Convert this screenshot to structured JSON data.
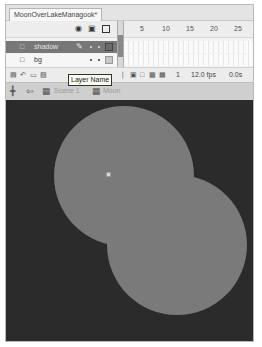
{
  "document": {
    "tab_title": "MoonOverLakeManagook*"
  },
  "timeline": {
    "header_icons": {
      "eye": "eye-icon",
      "lock": "lock-icon",
      "outline": "outline-square-icon"
    },
    "frame_ruler": [
      "5",
      "10",
      "15",
      "20",
      "25"
    ],
    "layers": [
      {
        "name": "shadow",
        "icon": "layer-icon",
        "selected": true,
        "editing": "pencil-icon"
      },
      {
        "name": "bg",
        "icon": "layer-icon",
        "selected": false
      }
    ],
    "footer": {
      "icons": [
        "new-layer-icon",
        "motion-guide-icon",
        "new-folder-icon",
        "delete-layer-icon"
      ],
      "frame_icons": [
        "center-frame-icon",
        "onion-skin-icon",
        "onion-outline-icon",
        "edit-multiple-icon",
        "modify-markers-icon"
      ],
      "current_frame": "1",
      "frame_rate": "12.0 fps",
      "elapsed_time": "0.0s"
    }
  },
  "tooltip": {
    "text": "Layer Name"
  },
  "edit_bar": {
    "icons": [
      "timeline-toggle-icon",
      "back-arrow-icon"
    ],
    "breadcrumbs": [
      {
        "label": "Scene 1",
        "icon": "scene-icon"
      },
      {
        "label": "Moon",
        "icon": "symbol-icon"
      }
    ]
  },
  "stage": {
    "background_color": "#2b2b2b",
    "shapes": [
      {
        "name": "moon-circle",
        "color": "#7a7a7a"
      },
      {
        "name": "shadow-circle",
        "color": "#7a7a7a"
      }
    ]
  }
}
